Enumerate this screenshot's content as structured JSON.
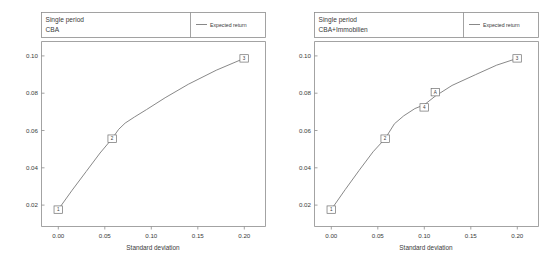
{
  "figure": {
    "background": "#ffffff",
    "line_color": "#7a7a7a",
    "frame_color": "#8c8c8c",
    "text_color": "#3b3b3b"
  },
  "panels": [
    {
      "id": "panel-left",
      "header_line1": "Single period",
      "header_line2": "CBA",
      "legend": {
        "label": "Expected return"
      },
      "chart_data": {
        "type": "line",
        "title": "Single period CBA",
        "xlabel": "Standard deviation",
        "ylabel": "",
        "xlim": [
          -0.018,
          0.223
        ],
        "ylim": [
          0.0,
          0.1095
        ],
        "xticks": [
          "0.00",
          "0.05",
          "0.10",
          "0.15",
          "0.20"
        ],
        "xtick_values": [
          0.0,
          0.05,
          0.1,
          0.15,
          0.2
        ],
        "yticks": [
          "0.02",
          "0.04",
          "0.06",
          "0.08",
          "0.10"
        ],
        "ytick_values": [
          0.02,
          0.04,
          0.06,
          0.08,
          0.1
        ],
        "grid": false,
        "legend_position": "top-right",
        "series": [
          {
            "name": "Expected return",
            "x": [
              0.0,
              0.015,
              0.03,
              0.045,
              0.058,
              0.065,
              0.072,
              0.082,
              0.095,
              0.115,
              0.14,
              0.17,
              0.2
            ],
            "y": [
              0.01,
              0.0215,
              0.0325,
              0.0435,
              0.052,
              0.0575,
              0.0612,
              0.0648,
              0.0692,
              0.0762,
              0.0842,
              0.0925,
              0.0995
            ]
          }
        ],
        "labeled_points": [
          {
            "label": "1",
            "x": 0.0,
            "y": 0.01
          },
          {
            "label": "2",
            "x": 0.058,
            "y": 0.052
          },
          {
            "label": "3",
            "x": 0.2,
            "y": 0.0995
          }
        ]
      }
    },
    {
      "id": "panel-right",
      "header_line1": "Single period",
      "header_line2": "CBA+Immobilien",
      "legend": {
        "label": "Expected return"
      },
      "chart_data": {
        "type": "line",
        "title": "Single period CBA+Immobilien",
        "xlabel": "Standard deviation",
        "ylabel": "",
        "xlim": [
          -0.018,
          0.223
        ],
        "ylim": [
          0.0,
          0.1095
        ],
        "xticks": [
          "0.00",
          "0.05",
          "0.10",
          "0.15",
          "0.20"
        ],
        "xtick_values": [
          0.0,
          0.05,
          0.1,
          0.15,
          0.2
        ],
        "yticks": [
          "0.02",
          "0.04",
          "0.06",
          "0.08",
          "0.10"
        ],
        "ytick_values": [
          0.02,
          0.04,
          0.06,
          0.08,
          0.1
        ],
        "grid": false,
        "legend_position": "top-right",
        "series": [
          {
            "name": "Expected return",
            "x": [
              0.0,
              0.015,
              0.03,
              0.045,
              0.058,
              0.068,
              0.078,
              0.09,
              0.1,
              0.112,
              0.13,
              0.155,
              0.178,
              0.2
            ],
            "y": [
              0.01,
              0.0218,
              0.0332,
              0.0442,
              0.052,
              0.0608,
              0.0655,
              0.0698,
              0.072,
              0.0772,
              0.0835,
              0.0898,
              0.0955,
              0.0995
            ]
          }
        ],
        "labeled_points": [
          {
            "label": "1",
            "x": 0.0,
            "y": 0.01
          },
          {
            "label": "2",
            "x": 0.058,
            "y": 0.052
          },
          {
            "label": "4",
            "x": 0.1,
            "y": 0.0705
          },
          {
            "label": "A",
            "x": 0.112,
            "y": 0.0795
          },
          {
            "label": "3",
            "x": 0.2,
            "y": 0.0995
          }
        ]
      }
    }
  ]
}
